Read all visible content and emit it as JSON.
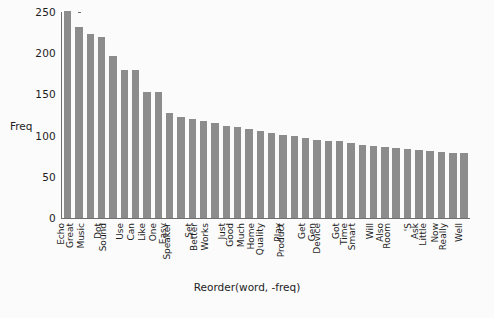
{
  "chart_data": {
    "type": "bar",
    "title": "",
    "xlabel": "Reorder(word, -freq)",
    "ylabel": "Freq",
    "ylim": [
      0,
      250
    ],
    "yticks": [
      0,
      50,
      100,
      150,
      200,
      250
    ],
    "grid": false,
    "legend": null,
    "bar_color": "#8c8c8c",
    "categories": [
      "Echo",
      "Great",
      "Music",
      "Dot",
      "Sound",
      "Use",
      "Can",
      "Like",
      "One",
      "Easy",
      "Speaker",
      "Set",
      "Better",
      "Works",
      "Just",
      "Good",
      "Much",
      "Home",
      "Quality",
      "Play",
      "Product",
      "Get",
      "Gen",
      "Device",
      "Got",
      "Time",
      "Smart",
      "Will",
      "Also",
      "Room",
      "'S",
      "Ask",
      "Little",
      "Now",
      "Really",
      "Well"
    ],
    "values": [
      251,
      232,
      223,
      220,
      197,
      180,
      180,
      153,
      153,
      128,
      123,
      120,
      118,
      115,
      112,
      110,
      108,
      105,
      103,
      101,
      99,
      97,
      95,
      94,
      93,
      91,
      89,
      87,
      86,
      85,
      84,
      83,
      81,
      80,
      79,
      79
    ]
  },
  "axes": {
    "y_title": "Freq",
    "x_title": "Reorder(word, -freq)"
  }
}
